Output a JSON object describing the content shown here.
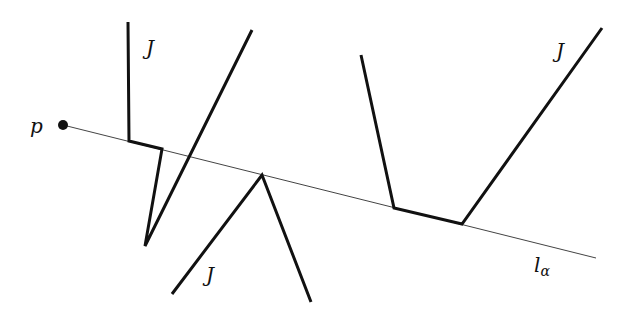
{
  "diagram": {
    "point": {
      "label": "p",
      "x": 63,
      "y": 125,
      "r": 5,
      "label_x": 30,
      "label_y": 133
    },
    "ray": {
      "label": "l",
      "subscript": "α",
      "x1": 63,
      "y1": 125,
      "x2": 596,
      "y2": 258,
      "label_x": 534,
      "label_y": 272,
      "stroke_width": 1
    },
    "curves": [
      {
        "name": "J",
        "points": "128,22 129,141 162,149 145,246 252,30",
        "label_x": 146,
        "label_y": 55
      },
      {
        "name": "J",
        "points": "172,294 262,175 311,302",
        "label_x": 206,
        "label_y": 282
      },
      {
        "name": "J",
        "points": "361,55 394,208 462,224 602,28",
        "label_x": 556,
        "label_y": 58
      }
    ],
    "colors": {
      "stroke": "#111111",
      "ray": "#444444",
      "background": "#ffffff"
    }
  }
}
